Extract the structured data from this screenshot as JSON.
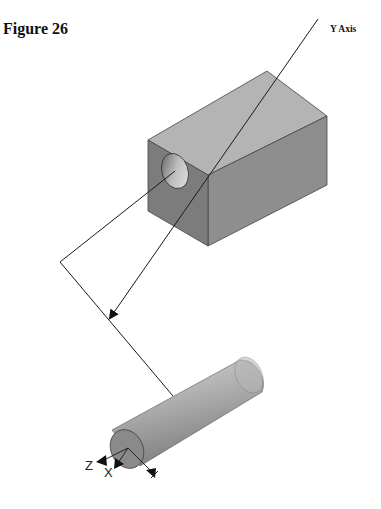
{
  "figure": {
    "title": "Figure 26",
    "y_axis_label": "Y Axis",
    "triad_labels": {
      "z": "Z",
      "x": "X"
    }
  },
  "colors": {
    "block_top": "#b4b4b4",
    "block_front": "#7c7c7c",
    "block_side": "#8e8e8e",
    "cylinder_light": "#c8c8c8",
    "cylinder_dark": "#8a8a8a",
    "line": "#1a1a1a"
  }
}
